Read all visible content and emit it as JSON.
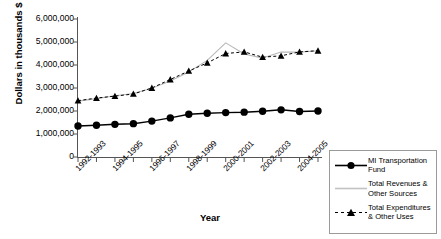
{
  "chart_data": {
    "type": "line",
    "title": "",
    "xlabel": "Year",
    "ylabel": "Dollars in thousands $",
    "ylim": [
      0,
      6000000
    ],
    "ytick_labels": [
      "6,000,000",
      "5,000,000",
      "4,000,000",
      "3,000,000",
      "2,000,000",
      "1,000,000",
      "0"
    ],
    "ytick_values": [
      6000000,
      5000000,
      4000000,
      3000000,
      2000000,
      1000000,
      0
    ],
    "grid": false,
    "legend_position": "right",
    "categories": [
      "1992-1993",
      "1993-1994",
      "1994-1995",
      "1995-1996",
      "1996-1997",
      "1997-1998",
      "1998-1999",
      "1999-2000",
      "2000-2001",
      "2001-2002",
      "2002-2003",
      "2003-2004",
      "2004-2005",
      "2005-2006"
    ],
    "xtick_labels_shown": [
      "1992-1993",
      "1994-1995",
      "1996-1997",
      "1998-1999",
      "2000-2001",
      "2002-2003",
      "2004-2005"
    ],
    "series": [
      {
        "name": "MI  Transportation\nFund",
        "marker": "circle",
        "color": "#000000",
        "style": "solid",
        "values": [
          1350000,
          1380000,
          1420000,
          1450000,
          1560000,
          1700000,
          1860000,
          1900000,
          1930000,
          1950000,
          1990000,
          2050000,
          1980000,
          2000000
        ]
      },
      {
        "name": "Total Revenues  &\nOther Sources",
        "marker": "none",
        "color": "#b8b8b8",
        "style": "solid",
        "values": [
          2430000,
          2540000,
          2660000,
          2760000,
          2990000,
          3300000,
          3700000,
          4200000,
          4960000,
          4480000,
          4300000,
          4560000,
          4560000,
          4620000
        ]
      },
      {
        "name": "Total Expenditures\n& Other Uses",
        "marker": "triangle",
        "color": "#000000",
        "style": "dashed",
        "values": [
          2450000,
          2560000,
          2650000,
          2740000,
          3000000,
          3370000,
          3740000,
          4090000,
          4500000,
          4570000,
          4340000,
          4400000,
          4570000,
          4620000
        ]
      }
    ]
  },
  "legend": {
    "items": [
      {
        "label": "MI  Transportation\nFund",
        "key": "line-circle-key"
      },
      {
        "label": "Total Revenues  &\nOther Sources",
        "key": "line-gray-key"
      },
      {
        "label": "Total Expenditures\n& Other Uses",
        "key": "line-triangle-key"
      }
    ]
  },
  "axes": {
    "y_title": "Dollars in thousands $",
    "x_title": "Year"
  }
}
